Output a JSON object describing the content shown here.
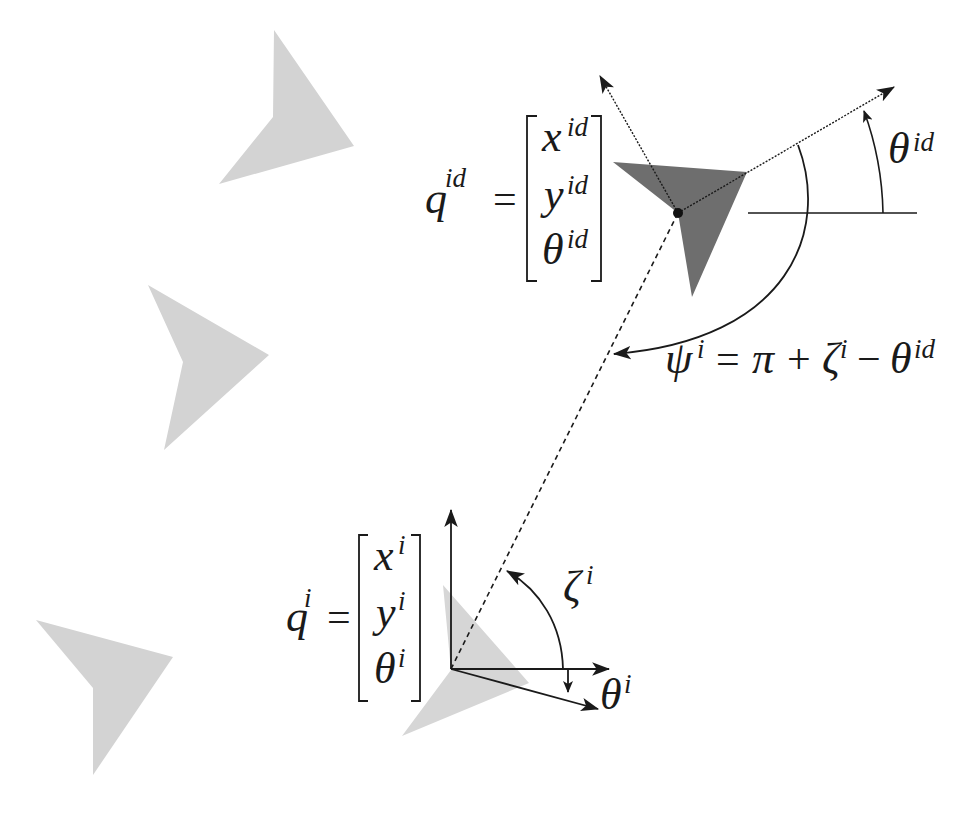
{
  "diagram": {
    "type": "robot-formation-geometry",
    "colors": {
      "ghost_robot": "#d3d3d3",
      "leader_robot": "#6e6e6e",
      "follower_robot": "#d6d6d6",
      "lines": "#1a1a1a"
    },
    "leader_state": {
      "lhs": "q",
      "lhs_sup": "id",
      "equals": "=",
      "entries": [
        {
          "sym": "x",
          "sup": "id"
        },
        {
          "sym": "y",
          "sup": "id"
        },
        {
          "sym": "θ",
          "sup": "id"
        }
      ]
    },
    "follower_state": {
      "lhs": "q",
      "lhs_sup": "i",
      "equals": "=",
      "entries": [
        {
          "sym": "x",
          "sup": "i"
        },
        {
          "sym": "y",
          "sup": "i"
        },
        {
          "sym": "θ",
          "sup": "i"
        }
      ]
    },
    "labels": {
      "theta_id": {
        "sym": "θ",
        "sup": "id"
      },
      "zeta_i": {
        "sym": "ζ",
        "sup": "i"
      },
      "theta_i": {
        "sym": "θ",
        "sup": "i"
      },
      "psi_equation": {
        "lhs": "ψ",
        "lhs_sup": "i",
        "rhs_parts": [
          "=",
          "π",
          "+",
          "ζ",
          "i",
          "−",
          "θ",
          "id"
        ]
      }
    }
  }
}
